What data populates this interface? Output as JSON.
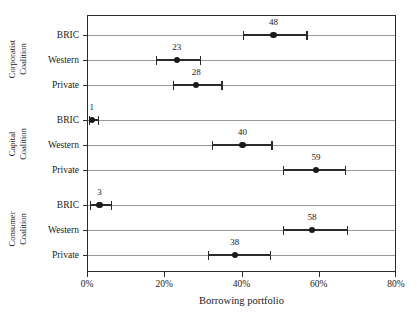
{
  "chart_data": {
    "type": "scatter",
    "title": "",
    "xlabel": "Borrowing portfolio",
    "ylabel": "",
    "xlim": [
      0,
      80
    ],
    "xtick_labels": [
      "0%",
      "20%",
      "40%",
      "60%",
      "80%"
    ],
    "xtick_values": [
      0,
      20,
      40,
      60,
      80
    ],
    "grid": true,
    "legend": "none",
    "orientation": "horizontal",
    "groups": [
      {
        "name": "Corporatist Coalition",
        "label_lines": [
          "Corporatist",
          "Coalition"
        ],
        "rows": [
          {
            "category": "BRIC",
            "value": 48,
            "value_label": "48",
            "low": 40.0,
            "high": 56.5
          },
          {
            "category": "Western",
            "value": 23,
            "value_label": "23",
            "low": 17.5,
            "high": 29.0
          },
          {
            "category": "Private",
            "value": 28,
            "value_label": "28",
            "low": 22.0,
            "high": 34.5
          }
        ]
      },
      {
        "name": "Capital Coalition",
        "label_lines": [
          "Capital",
          "Coalition"
        ],
        "rows": [
          {
            "category": "BRIC",
            "value": 1,
            "value_label": "1",
            "low": 0.2,
            "high": 2.6
          },
          {
            "category": "Western",
            "value": 40,
            "value_label": "40",
            "low": 32.0,
            "high": 47.5
          },
          {
            "category": "Private",
            "value": 59,
            "value_label": "59",
            "low": 50.5,
            "high": 66.5
          }
        ]
      },
      {
        "name": "Consumer Coalition",
        "label_lines": [
          "Consumer",
          "Coalition"
        ],
        "rows": [
          {
            "category": "BRIC",
            "value": 3,
            "value_label": "3",
            "low": 0.5,
            "high": 6.0
          },
          {
            "category": "Western",
            "value": 58,
            "value_label": "58",
            "low": 50.5,
            "high": 67.0
          },
          {
            "category": "Private",
            "value": 38,
            "value_label": "38",
            "low": 31.0,
            "high": 47.0
          }
        ]
      }
    ]
  },
  "colors": {
    "marker": "#1a1a1a",
    "gridline": "#9a9a9a",
    "axis": "#2b2b2b",
    "background": "#ffffff"
  }
}
